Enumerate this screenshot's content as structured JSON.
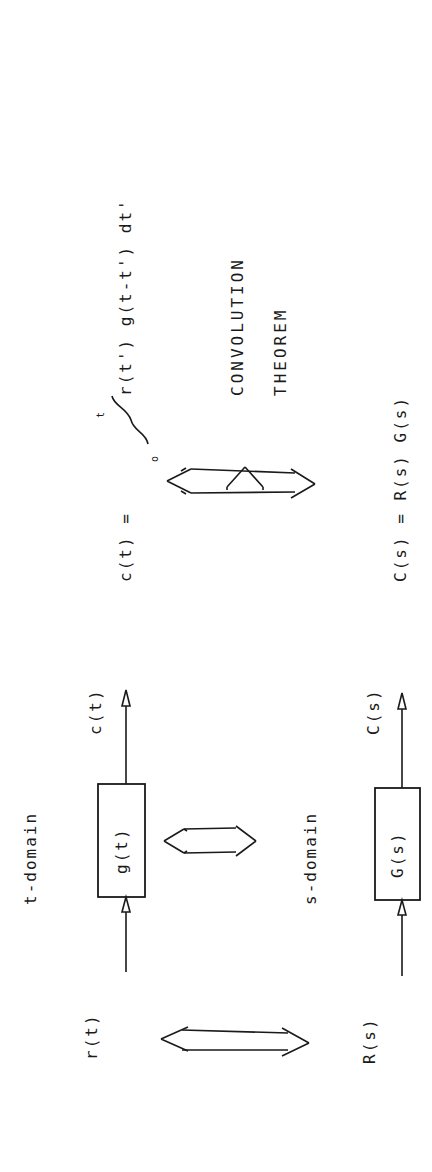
{
  "diagram": {
    "orientation": "rotated-90-ccw",
    "t_domain": {
      "label": "t-domain",
      "input": "r(t)",
      "block": "g(t)",
      "output": "c(t)"
    },
    "s_domain": {
      "label": "s-domain",
      "input": "R(s)",
      "block": "G(s)",
      "output": "C(s)"
    },
    "equations": {
      "time_lhs": "c(t) =",
      "integral_upper": "t",
      "integral_lower": "o",
      "time_rhs": "r(t')  g(t-t')  dt'",
      "laplace": "C(s) = R(s)  G(s)"
    },
    "theorem": {
      "line1": "CONVOLUTION",
      "line2": "THEOREM"
    },
    "colors": {
      "ink": "#1a1a1a",
      "background": "#ffffff"
    }
  }
}
